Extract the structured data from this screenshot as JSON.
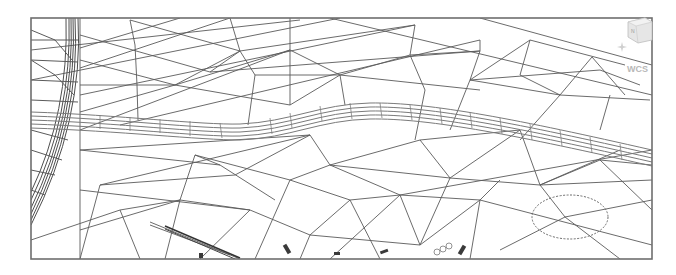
{
  "viewport": {
    "type": "cad-wireframe-drawing",
    "description": "TIN surface triangulation mesh with road corridor",
    "background": "#ffffff",
    "line_color": "#5a5a5a"
  },
  "navigation": {
    "viewcube": {
      "label": "",
      "face_text": "N"
    },
    "compass_icon": "compass-star",
    "ucs_label": "WCS"
  },
  "annotations": {
    "revision_cloud": {
      "shape": "cloud",
      "cx": 570,
      "cy": 217
    }
  }
}
